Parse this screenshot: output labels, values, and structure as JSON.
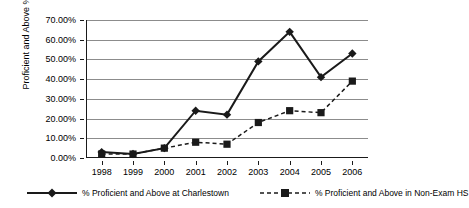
{
  "chart_data": {
    "type": "line",
    "title": "",
    "xlabel": "",
    "ylabel": "Proficient and Above %",
    "categories": [
      "1998",
      "1999",
      "2000",
      "2001",
      "2002",
      "2003",
      "2004",
      "2005",
      "2006"
    ],
    "ylim": [
      0,
      70
    ],
    "ytick_values": [
      0,
      10,
      20,
      30,
      40,
      50,
      60,
      70
    ],
    "ytick_labels": [
      "0.00%",
      "10.00%",
      "20.00%",
      "30.00%",
      "40.00%",
      "50.00%",
      "60.00%",
      "70.00%"
    ],
    "grid": true,
    "legend_position": "bottom",
    "series": [
      {
        "name": "% Proficient and Above at Charlestown",
        "marker": "diamond",
        "line_style": "solid",
        "color": "#1a1a1a",
        "values": [
          3.0,
          2.0,
          5.0,
          24.0,
          22.0,
          49.0,
          64.0,
          41.0,
          53.0
        ]
      },
      {
        "name": "% Proficient and Above in Non-Exam HS",
        "marker": "square",
        "line_style": "dashed",
        "color": "#1a1a1a",
        "values": [
          2.0,
          2.0,
          5.0,
          8.0,
          7.0,
          18.0,
          24.0,
          23.0,
          39.0
        ]
      }
    ]
  },
  "legend": {
    "entries": [
      {
        "label": "% Proficient and Above at Charlestown"
      },
      {
        "label": "% Proficient and Above in Non-Exam HS"
      }
    ]
  }
}
